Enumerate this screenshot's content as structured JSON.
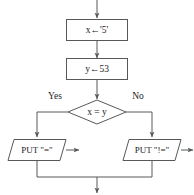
{
  "diagram": {
    "type": "flowchart",
    "title": "",
    "entry_arrow": "down-arrow-into-first-process",
    "exit_arrow": "down-arrow-out-of-merge",
    "nodes": [
      {
        "id": "assign_x",
        "shape": "process",
        "text": "x←'5'"
      },
      {
        "id": "assign_y",
        "shape": "process",
        "text": "y←53"
      },
      {
        "id": "compare",
        "shape": "decision",
        "text": "x = y"
      },
      {
        "id": "out_equal",
        "shape": "input-output",
        "text": "PUT \"=\""
      },
      {
        "id": "out_not_equal",
        "shape": "input-output",
        "text": "PUT \"!=\""
      }
    ],
    "branch_labels": {
      "yes": "Yes",
      "no": "No"
    },
    "colors": {
      "stroke": "#55595c",
      "text": "#1b1b1b",
      "fill": "#ffffff",
      "background": "#ffffff"
    }
  }
}
